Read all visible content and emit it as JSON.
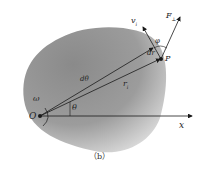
{
  "figure": {
    "caption": "（b）",
    "labels": {
      "origin": "O",
      "x_axis": "x",
      "point": "P",
      "angular_velocity": "ω",
      "velocity": "v",
      "velocity_sub": "i",
      "force": "F",
      "force_sub": "⊥",
      "phi": "φ",
      "dr": "dr",
      "dtheta": "dθ",
      "radius": "r",
      "radius_sub": "i",
      "theta": "θ"
    },
    "colors": {
      "body_fill_dark": "#7a7a7a",
      "body_fill_light": "#d8d8d8",
      "lines": "#1a1a1a"
    }
  }
}
